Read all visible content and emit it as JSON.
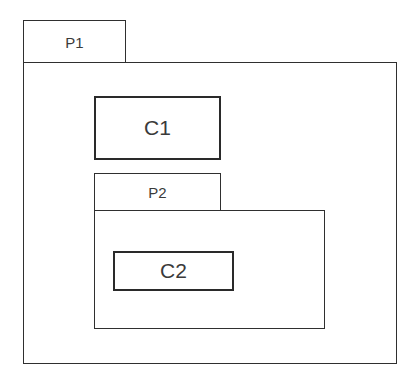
{
  "diagram": {
    "type": "package-component-nesting",
    "packages": [
      {
        "id": "p1",
        "label": "P1"
      },
      {
        "id": "p2",
        "label": "P2",
        "parent": "P1"
      }
    ],
    "components": [
      {
        "id": "c1",
        "label": "C1",
        "parent": "P1"
      },
      {
        "id": "c2",
        "label": "C2",
        "parent": "P2"
      }
    ]
  }
}
